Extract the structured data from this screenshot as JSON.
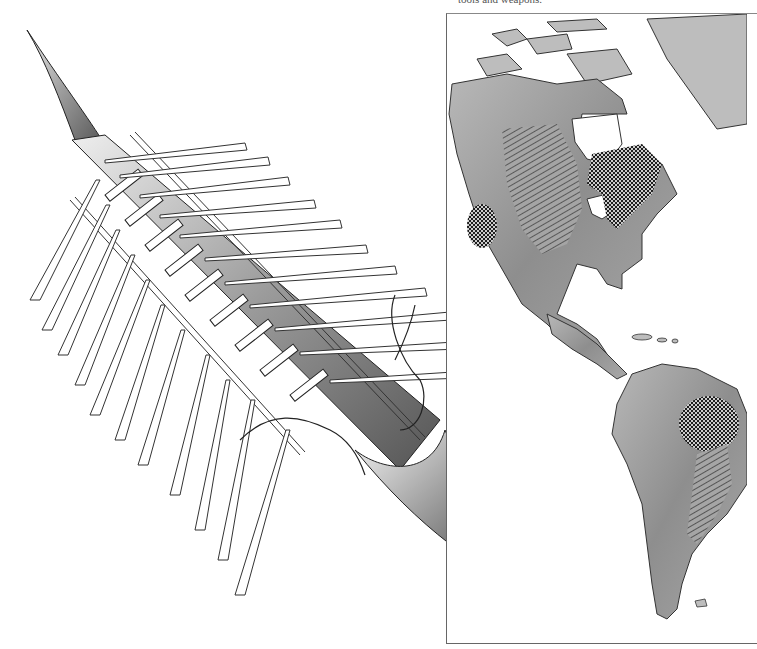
{
  "page": {
    "type": "illustrated book page (scan)",
    "caption_fragment_left": "",
    "caption_fragment_right": "tools and weapons."
  },
  "illustration_left": {
    "subject": "long canoe / dugout boat with outrigger poles and oars, isometric pen-and-ink drawing",
    "oars_left_side": 11,
    "oars_right_side": 13,
    "colors": {
      "ink": "#222222",
      "shade": "#8a8a8a",
      "paper": "#ffffff"
    }
  },
  "illustration_right": {
    "subject": "shaded relief map of the Americas",
    "regions_marked": [
      {
        "pattern": "crosshatch-dots",
        "location": "eastern Canada / Great Lakes"
      },
      {
        "pattern": "crosshatch-dots",
        "location": "western United States (California/Great Basin)"
      },
      {
        "pattern": "diagonal-lines",
        "location": "central North America (Great Plains)"
      },
      {
        "pattern": "crosshatch-dots",
        "location": "eastern Amazon basin, South America"
      },
      {
        "pattern": "diagonal-lines",
        "location": "south-eastern South America"
      }
    ],
    "colors": {
      "land": "#9a9a9a",
      "ocean": "#ffffff",
      "hatch": "#1e1e1e",
      "frame": "#666666"
    }
  }
}
